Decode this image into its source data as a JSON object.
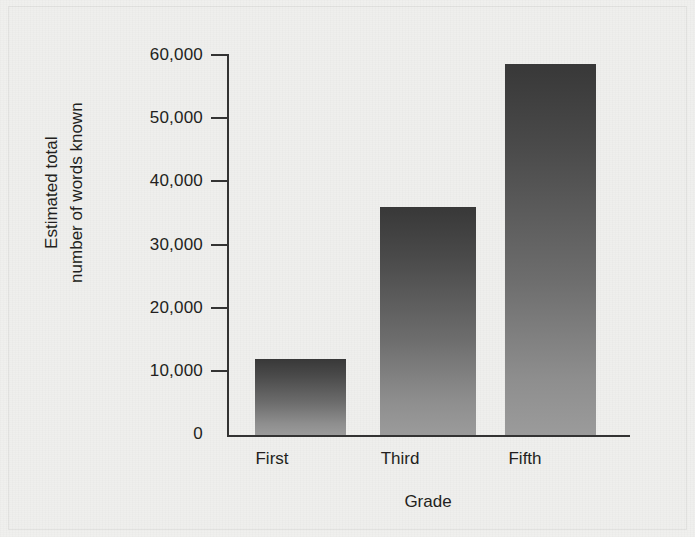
{
  "chart_data": {
    "type": "bar",
    "title": "",
    "subtitle": "",
    "xlabel": "Grade",
    "ylabel": "Estimated total number of words known",
    "ylabel_line1": "Estimated total",
    "ylabel_line2": "number of words known",
    "categories": [
      "First",
      "Third",
      "Fifth"
    ],
    "values": [
      12000,
      36000,
      58500
    ],
    "series": [
      {
        "name": "Estimated total number of words known",
        "values": [
          12000,
          36000,
          58500
        ]
      }
    ],
    "ylim": [
      0,
      60000
    ],
    "ytick_values": [
      0,
      10000,
      20000,
      30000,
      40000,
      50000,
      60000
    ],
    "ytick_labels": [
      "0",
      "10,000",
      "20,000",
      "30,000",
      "40,000",
      "50,000",
      "60,000"
    ],
    "grid": false,
    "legend": null,
    "legend_position": "none",
    "annotations": []
  },
  "style": {
    "background_color": "#efefed",
    "axis_color": "#333333",
    "text_color": "#231f20",
    "bar_top_color": "#383838",
    "bar_bottom_color": "#9b9b9b",
    "bar_shadow_color": "#8b8b8b"
  }
}
